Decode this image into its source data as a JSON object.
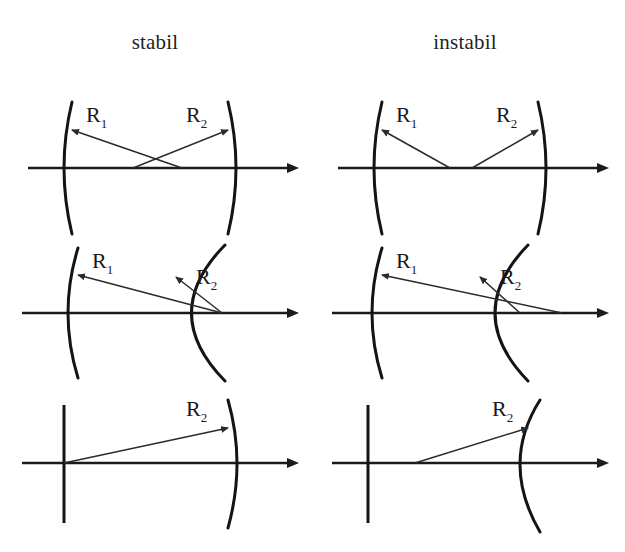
{
  "figure": {
    "title_columns": [
      {
        "id": "stabil",
        "label": "stabil"
      },
      {
        "id": "instabil",
        "label": "instabil"
      }
    ],
    "labels": {
      "r1_symbol": "R",
      "r1_subscript": "1",
      "r2_symbol": "R",
      "r2_subscript": "2"
    },
    "colors": {
      "background": "#ffffff",
      "ink": "#1a1a1a",
      "mirror": "#141414",
      "axis": "#1b1b1b",
      "ray": "#2b2b2b"
    },
    "rows": [
      {
        "id": "row-1",
        "description": "two concave mirrors facing each other",
        "stable": {
          "left_mirror": "concave",
          "right_mirror": "concave",
          "r1_label": "R",
          "r1_subscript": "1",
          "r2_label": "R",
          "r2_subscript": "2",
          "rays_cross": "yes"
        },
        "unstable": {
          "left_mirror": "concave",
          "right_mirror": "concave",
          "r1_label": "R",
          "r1_subscript": "1",
          "r2_label": "R",
          "r2_subscript": "2",
          "rays_cross": "no"
        }
      },
      {
        "id": "row-2",
        "description": "concave mirror with convex mirror",
        "stable": {
          "left_mirror": "concave",
          "right_mirror": "convex",
          "r1_label": "R",
          "r1_subscript": "1",
          "r2_label": "R",
          "r2_subscript": "2",
          "rays_cross": "centers coincide"
        },
        "unstable": {
          "left_mirror": "concave",
          "right_mirror": "convex",
          "r1_label": "R",
          "r1_subscript": "1",
          "r2_label": "R",
          "r2_subscript": "2",
          "rays_cross": "centers separated"
        }
      },
      {
        "id": "row-3",
        "description": "plane mirror with concave mirror",
        "stable": {
          "left_mirror": "plane",
          "right_mirror": "concave",
          "r2_label": "R",
          "r2_subscript": "2",
          "center_at": "plane mirror"
        },
        "unstable": {
          "left_mirror": "plane",
          "right_mirror": "concave",
          "r2_label": "R",
          "r2_subscript": "2",
          "center_at": "between mirrors"
        }
      }
    ]
  }
}
